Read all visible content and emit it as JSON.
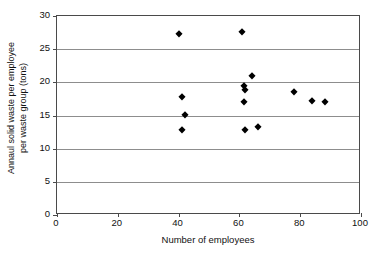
{
  "chart_data": {
    "type": "scatter",
    "title": "",
    "xlabel": "Number of employees",
    "ylabel": "Annaul solid waste per employee per waste group (tons)",
    "ylabel_line1": "Annaul solid waste per employee",
    "ylabel_line2": "per waste group (tons)",
    "xlim": [
      0,
      100
    ],
    "ylim": [
      0,
      30
    ],
    "xticks": [
      0,
      20,
      40,
      60,
      80,
      100
    ],
    "yticks": [
      0,
      5,
      10,
      15,
      20,
      25,
      30
    ],
    "grid": "horizontal",
    "legend": "none",
    "marker": "filled-diamond",
    "marker_color": "#000000",
    "series": [
      {
        "name": "waste group",
        "points": [
          {
            "x": 40.0,
            "y": 27.3
          },
          {
            "x": 61.0,
            "y": 27.6
          },
          {
            "x": 64.0,
            "y": 21.0
          },
          {
            "x": 61.5,
            "y": 19.4
          },
          {
            "x": 62.0,
            "y": 18.9
          },
          {
            "x": 78.0,
            "y": 18.6
          },
          {
            "x": 41.0,
            "y": 17.8
          },
          {
            "x": 84.0,
            "y": 17.2
          },
          {
            "x": 61.5,
            "y": 17.0
          },
          {
            "x": 88.0,
            "y": 17.0
          },
          {
            "x": 42.0,
            "y": 15.1
          },
          {
            "x": 66.0,
            "y": 13.2
          },
          {
            "x": 41.0,
            "y": 12.8
          },
          {
            "x": 62.0,
            "y": 12.8
          }
        ]
      }
    ]
  }
}
